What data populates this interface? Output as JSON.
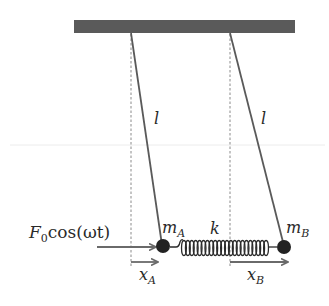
{
  "diagram": {
    "title": "",
    "colors": {
      "ceiling": "#5a5a5a",
      "string": "#5a5a5a",
      "mass": "#222222",
      "arrow": "#6a6a6a",
      "dashed": "#8a8a8a",
      "text": "#2a2a2a",
      "spring": "#2a2a2a"
    },
    "ceiling": {
      "x1": 74,
      "x2": 295,
      "y": 20,
      "height": 13
    },
    "pendulums": [
      {
        "id": "A",
        "pivot": [
          131,
          33
        ],
        "mass_center": [
          163,
          246
        ],
        "string_label": "l",
        "label_pos": [
          157,
          124
        ]
      },
      {
        "id": "B",
        "pivot": [
          230,
          33
        ],
        "mass_center": [
          284,
          247
        ],
        "string_label": "l",
        "label_pos": [
          263,
          124
        ]
      }
    ],
    "masses": [
      {
        "id": "A",
        "label_main": "m",
        "label_sub": "A",
        "radius": 7
      },
      {
        "id": "B",
        "label_main": "m",
        "label_sub": "B",
        "radius": 7
      }
    ],
    "spring": {
      "label": "k",
      "x_start": 182,
      "x_end": 268,
      "coils": 22
    },
    "force": {
      "label_main": "F",
      "label_sub": "0",
      "label_rest": "cos(ωt)"
    },
    "displacements": [
      {
        "id": "A",
        "label_main": "x",
        "label_sub": "A"
      },
      {
        "id": "B",
        "label_main": "x",
        "label_sub": "B"
      }
    ]
  }
}
